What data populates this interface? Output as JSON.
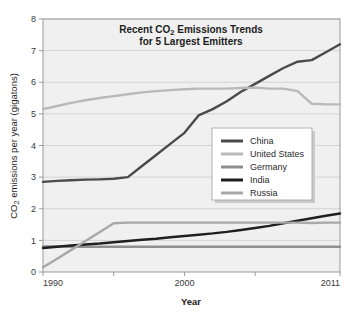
{
  "chart_data": {
    "type": "line",
    "title": "Recent CO2 Emissions Trends for 5 Largest Emitters",
    "title_line1_pre": "Recent CO",
    "title_line1_sub": "2",
    "title_line1_post": " Emissions Trends",
    "title_line2": "for 5 Largest Emitters",
    "xlabel": "Year",
    "ylabel": "CO2 emissions per year (gigatons)",
    "ylabel_pre": "CO",
    "ylabel_sub": "2",
    "ylabel_post": " emissions per year (gigatons)",
    "xlim": [
      1990,
      2011
    ],
    "ylim": [
      0,
      8
    ],
    "grid": true,
    "grid_axis": "y",
    "legend_position": "center-right",
    "x_tick_labels": [
      "1990",
      "2000",
      "2011"
    ],
    "x_tick_values": [
      1990,
      2000,
      2011
    ],
    "x_minor_ticks": [
      1995,
      2005
    ],
    "y_tick_labels": [
      "0",
      "1",
      "2",
      "3",
      "4",
      "5",
      "6",
      "7",
      "8"
    ],
    "y_tick_values": [
      0,
      1,
      2,
      3,
      4,
      5,
      6,
      7,
      8
    ],
    "x": [
      1990,
      1991,
      1992,
      1993,
      1994,
      1995,
      1996,
      1997,
      1998,
      1999,
      2000,
      2001,
      2002,
      2003,
      2004,
      2005,
      2006,
      2007,
      2008,
      2009,
      2010,
      2011
    ],
    "series": [
      {
        "name": "China",
        "color": "#4a4a4a",
        "values": [
          2.85,
          2.88,
          2.9,
          2.92,
          2.93,
          2.95,
          3.0,
          3.35,
          3.7,
          4.05,
          4.4,
          4.95,
          5.15,
          5.4,
          5.7,
          5.95,
          6.2,
          6.45,
          6.65,
          6.7,
          6.95,
          7.2
        ]
      },
      {
        "name": "United States",
        "color": "#b9b9b9",
        "values": [
          5.15,
          5.25,
          5.35,
          5.43,
          5.5,
          5.56,
          5.62,
          5.68,
          5.72,
          5.75,
          5.78,
          5.8,
          5.8,
          5.8,
          5.82,
          5.83,
          5.8,
          5.8,
          5.72,
          5.32,
          5.3,
          5.3
        ]
      },
      {
        "name": "Germany",
        "color": "#8f8f8f",
        "values": [
          0.81,
          0.81,
          0.8,
          0.8,
          0.8,
          0.8,
          0.8,
          0.8,
          0.8,
          0.8,
          0.8,
          0.8,
          0.8,
          0.8,
          0.8,
          0.8,
          0.8,
          0.8,
          0.8,
          0.8,
          0.8,
          0.8
        ]
      },
      {
        "name": "India",
        "color": "#1f1f1f",
        "values": [
          0.76,
          0.8,
          0.84,
          0.87,
          0.9,
          0.94,
          0.98,
          1.02,
          1.05,
          1.1,
          1.14,
          1.18,
          1.22,
          1.27,
          1.33,
          1.39,
          1.46,
          1.54,
          1.62,
          1.7,
          1.78,
          1.85
        ]
      },
      {
        "name": "Russia",
        "color": "#a8a8a8",
        "values": [
          0.15,
          0.42,
          0.7,
          0.98,
          1.26,
          1.54,
          1.56,
          1.56,
          1.56,
          1.56,
          1.56,
          1.56,
          1.56,
          1.56,
          1.56,
          1.56,
          1.56,
          1.56,
          1.56,
          1.55,
          1.56,
          1.56
        ]
      }
    ]
  },
  "colors": {
    "plot_background": "#f0f0f0",
    "grid_line": "#d4d4d4",
    "axis_line": "#9a9a9a",
    "legend_background": "#ffffff",
    "legend_border": "#b0b0b0",
    "text": "#1d1d1d"
  },
  "legend": {
    "items": [
      {
        "label": "China",
        "color": "#4a4a4a"
      },
      {
        "label": "United States",
        "color": "#b9b9b9"
      },
      {
        "label": "Germany",
        "color": "#8f8f8f"
      },
      {
        "label": "India",
        "color": "#1f1f1f"
      },
      {
        "label": "Russia",
        "color": "#a8a8a8"
      }
    ]
  }
}
